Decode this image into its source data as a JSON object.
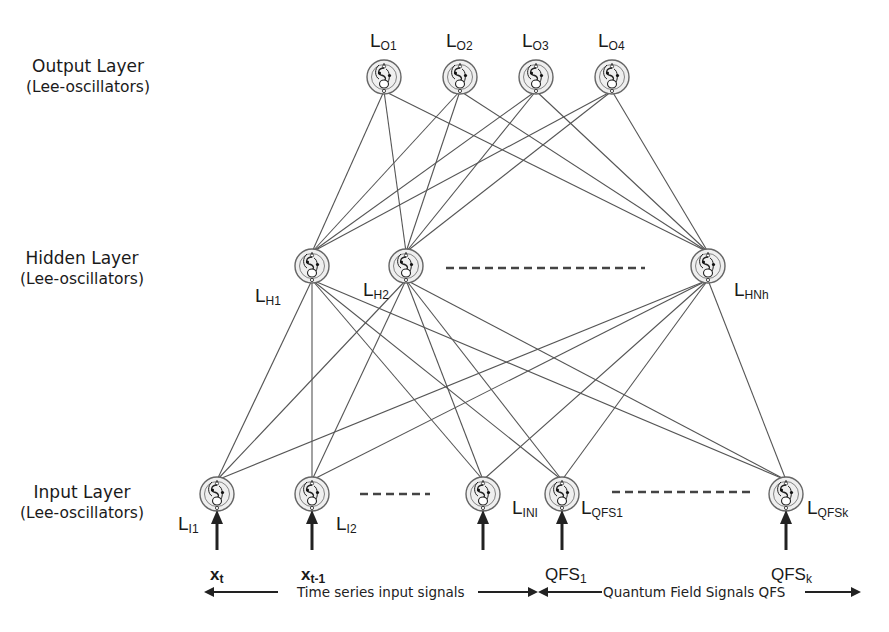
{
  "layers": {
    "output": {
      "title": "Output Layer",
      "subtitle": "(Lee-oscillators)"
    },
    "hidden": {
      "title": "Hidden Layer",
      "subtitle": "(Lee-oscillators)"
    },
    "input": {
      "title": "Input Layer",
      "subtitle": "(Lee-oscillators)"
    }
  },
  "nodes": {
    "output": [
      {
        "id": "O1",
        "base": "L",
        "sub": "O1",
        "x": 384,
        "y": 77
      },
      {
        "id": "O2",
        "base": "L",
        "sub": "O2",
        "x": 460,
        "y": 77
      },
      {
        "id": "O3",
        "base": "L",
        "sub": "O3",
        "x": 536,
        "y": 77
      },
      {
        "id": "O4",
        "base": "L",
        "sub": "O4",
        "x": 612,
        "y": 77
      }
    ],
    "hidden": [
      {
        "id": "H1",
        "base": "L",
        "sub": "H1",
        "x": 312,
        "y": 266
      },
      {
        "id": "H2",
        "base": "L",
        "sub": "H2",
        "x": 406,
        "y": 266
      },
      {
        "id": "HNh",
        "base": "L",
        "sub": "HNh",
        "x": 708,
        "y": 266
      }
    ],
    "input": [
      {
        "id": "I1",
        "base": "L",
        "sub": "I1",
        "x": 217,
        "y": 494
      },
      {
        "id": "I2",
        "base": "L",
        "sub": "I2",
        "x": 312,
        "y": 494
      },
      {
        "id": "INI",
        "base": "L",
        "sub": "INI",
        "x": 483,
        "y": 494
      },
      {
        "id": "QFS1",
        "base": "L",
        "sub": "QFS1",
        "x": 562,
        "y": 494
      },
      {
        "id": "QFSk",
        "base": "L",
        "sub": "QFSk",
        "x": 786,
        "y": 494
      }
    ]
  },
  "ellipsis": {
    "hidden": "- - - - - - - - - - - - - - - -",
    "input_left": "- - - - - -",
    "input_right": "- - - - - - - - - - -"
  },
  "signals": {
    "xt": {
      "base": "x",
      "sub": "t"
    },
    "xt1": {
      "base": "x",
      "sub": "t-1"
    },
    "qfs1": {
      "base": "QFS",
      "sub": "1"
    },
    "qfsk": {
      "base": "QFS",
      "sub": "k"
    }
  },
  "captions": {
    "time_series": "Time series input signals",
    "quantum": "Quantum Field Signals QFS"
  },
  "colors": {
    "line": "#4a4a4a",
    "node_fill": "#ececec",
    "node_stroke": "#555555",
    "text": "#1a1a1a",
    "background": "#ffffff"
  }
}
